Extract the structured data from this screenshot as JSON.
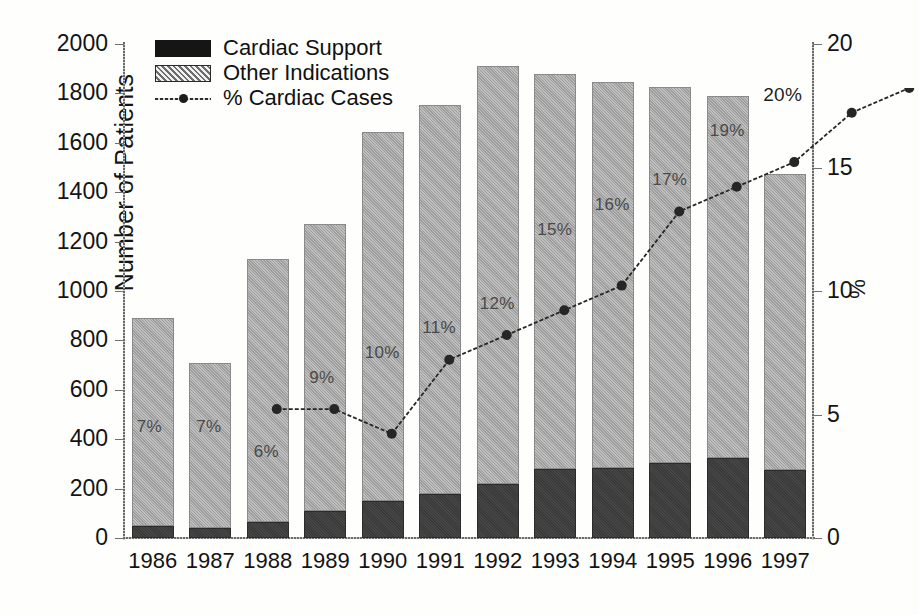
{
  "chart_data": {
    "type": "bar",
    "title": "",
    "subtitle": "",
    "xlabel": "",
    "ylabel": "Number of Patients",
    "y2label": "%",
    "ylim": [
      0,
      2000
    ],
    "y2lim": [
      0,
      20
    ],
    "grid": false,
    "legend_position": "top-left",
    "categories": [
      "1986",
      "1987",
      "1988",
      "1989",
      "1990",
      "1991",
      "1992",
      "1993",
      "1994",
      "1995",
      "1996",
      "1997"
    ],
    "yticks": [
      0,
      200,
      400,
      600,
      800,
      1000,
      1200,
      1400,
      1600,
      1800,
      2000
    ],
    "ytick_labels": [
      "0",
      "200",
      "400",
      "600",
      "800",
      "1000",
      "1200",
      "1400",
      "1600",
      "1800",
      "2000"
    ],
    "y2ticks": [
      0,
      5,
      10,
      15,
      20
    ],
    "y2tick_labels": [
      "0",
      "5",
      "10",
      "15",
      "20"
    ],
    "series": [
      {
        "name": "Cardiac Support",
        "kind": "bar-segment",
        "color": "#3a3a3a",
        "values": [
          50,
          40,
          65,
          110,
          150,
          180,
          220,
          280,
          285,
          305,
          325,
          275
        ]
      },
      {
        "name": "Other Indications",
        "kind": "bar-segment",
        "color": "#9d9d9d",
        "values": [
          840,
          670,
          1065,
          1160,
          1495,
          1575,
          1690,
          1600,
          1560,
          1520,
          1465,
          1200
        ]
      },
      {
        "name": "% Cardiac Cases",
        "kind": "line",
        "axis": "right",
        "color": "#262626",
        "values": [
          7,
          7,
          6,
          9,
          10,
          11,
          12,
          15,
          16,
          17,
          19,
          20
        ]
      }
    ],
    "bar_totals": [
      890,
      710,
      1130,
      1270,
      1645,
      1755,
      1910,
      1880,
      1845,
      1825,
      1790,
      1475
    ],
    "point_labels": [
      "7%",
      "7%",
      "6%",
      "9%",
      "10%",
      "11%",
      "12%",
      "15%",
      "16%",
      "17%",
      "19%",
      "20%"
    ]
  },
  "legend": {
    "items": [
      {
        "label": "Cardiac Support",
        "swatch": "black-square"
      },
      {
        "label": "Other Indications",
        "swatch": "hatched-square"
      },
      {
        "label": "% Cardiac Cases",
        "swatch": "line-with-marker"
      }
    ]
  },
  "axes": {
    "left_title": "Number of Patients",
    "right_title": "%"
  }
}
